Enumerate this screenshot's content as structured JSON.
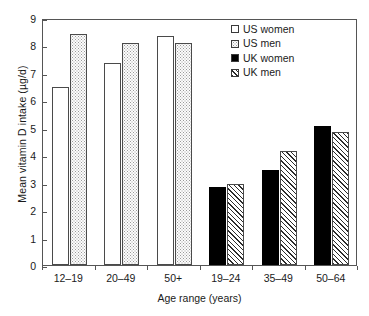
{
  "chart_data": {
    "type": "bar",
    "title": "",
    "xlabel": "Age range (years)",
    "ylabel": "Mean vitamin D intake (µg/d)",
    "ylim": [
      0,
      9
    ],
    "yticks": [
      0,
      1,
      2,
      3,
      4,
      5,
      6,
      7,
      8,
      9
    ],
    "ytick_labels": [
      "0",
      "1",
      "2",
      "3",
      "4",
      "5",
      "6",
      "7",
      "8",
      "9"
    ],
    "grid": false,
    "legend_position": "top-right",
    "categories": [
      "12–19",
      "20–49",
      "50+",
      "19–24",
      "35–49",
      "50–64"
    ],
    "series": [
      {
        "name": "US women",
        "fill": "open",
        "values": [
          6.5,
          7.35,
          8.35,
          null,
          null,
          null
        ]
      },
      {
        "name": "US men",
        "fill": "dots",
        "values": [
          8.4,
          8.1,
          8.1,
          null,
          null,
          null
        ]
      },
      {
        "name": "UK women",
        "fill": "solid",
        "values": [
          null,
          null,
          null,
          2.85,
          3.45,
          5.05
        ]
      },
      {
        "name": "UK men",
        "fill": "hatch",
        "values": [
          null,
          null,
          null,
          2.95,
          4.15,
          4.85
        ]
      }
    ],
    "bars": [
      {
        "group": "12–19",
        "series": "US women",
        "value": 6.5,
        "fill": "open"
      },
      {
        "group": "12–19",
        "series": "US men",
        "value": 8.4,
        "fill": "dots"
      },
      {
        "group": "20–49",
        "series": "US women",
        "value": 7.35,
        "fill": "open"
      },
      {
        "group": "20–49",
        "series": "US men",
        "value": 8.1,
        "fill": "dots"
      },
      {
        "group": "50+",
        "series": "US women",
        "value": 8.35,
        "fill": "open"
      },
      {
        "group": "50+",
        "series": "US men",
        "value": 8.1,
        "fill": "dots"
      },
      {
        "group": "19–24",
        "series": "UK women",
        "value": 2.85,
        "fill": "solid"
      },
      {
        "group": "19–24",
        "series": "UK men",
        "value": 2.95,
        "fill": "hatch"
      },
      {
        "group": "35–49",
        "series": "UK women",
        "value": 3.45,
        "fill": "solid"
      },
      {
        "group": "35–49",
        "series": "UK men",
        "value": 4.15,
        "fill": "hatch"
      },
      {
        "group": "50–64",
        "series": "UK women",
        "value": 5.05,
        "fill": "solid"
      },
      {
        "group": "50–64",
        "series": "UK men",
        "value": 4.85,
        "fill": "hatch"
      }
    ],
    "legend": [
      {
        "label": "US women",
        "fill": "open"
      },
      {
        "label": "US men",
        "fill": "dots"
      },
      {
        "label": "UK women",
        "fill": "solid"
      },
      {
        "label": "UK men",
        "fill": "hatch"
      }
    ]
  },
  "colors": {
    "axis": "#555555",
    "bar_outline": "#4a4a4a",
    "solid_fill": "#000000",
    "background": "#ffffff",
    "text": "#1a1a1a"
  }
}
